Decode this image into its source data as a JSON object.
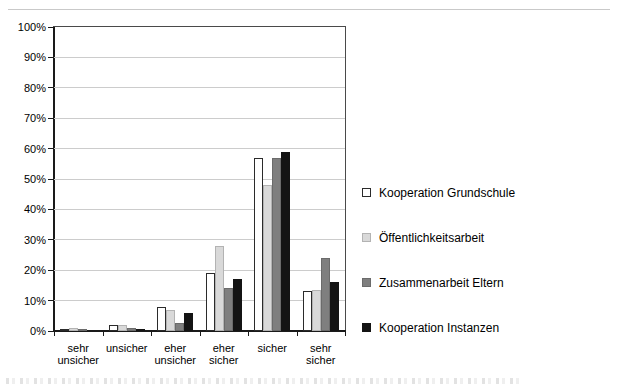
{
  "chart_data": {
    "type": "bar",
    "title": "",
    "xlabel": "",
    "ylabel": "",
    "ylim": [
      0,
      100
    ],
    "ytick_step": 10,
    "ytick_labels": [
      "0%",
      "10%",
      "20%",
      "30%",
      "40%",
      "50%",
      "60%",
      "70%",
      "80%",
      "90%",
      "100%"
    ],
    "grid": true,
    "legend_position": "right",
    "categories": [
      "sehr unsicher",
      "unsicher",
      "eher unsicher",
      "eher sicher",
      "sicher",
      "sehr sicher"
    ],
    "category_label_lines": [
      [
        "sehr",
        "unsicher"
      ],
      [
        "unsicher"
      ],
      [
        "eher",
        "unsicher"
      ],
      [
        "eher",
        "sicher"
      ],
      [
        "sicher"
      ],
      [
        "sehr",
        "sicher"
      ]
    ],
    "series": [
      {
        "name": "Kooperation Grundschule",
        "fill": "#ffffff",
        "border": "#2b2b2b",
        "values": [
          0.5,
          2,
          8,
          19,
          57,
          13
        ]
      },
      {
        "name": "Öffentlichkeitsarbeit",
        "fill": "#d9d9d9",
        "border": "#b3b3b3",
        "values": [
          1,
          2,
          7,
          28,
          48,
          13.5
        ]
      },
      {
        "name": "Zusammenarbeit Eltern",
        "fill": "#7f7f7f",
        "border": "#6b6b6b",
        "values": [
          0.5,
          1,
          2.5,
          14,
          57,
          24
        ]
      },
      {
        "name": "Kooperation Instanzen",
        "fill": "#141414",
        "border": "#141414",
        "values": [
          0,
          0.5,
          6,
          17,
          59,
          16
        ]
      }
    ],
    "colors": {
      "grid": "#cccccc",
      "axis": "#1a1a1a",
      "plot_border": "#4a4a4a",
      "background": "#ffffff"
    }
  }
}
